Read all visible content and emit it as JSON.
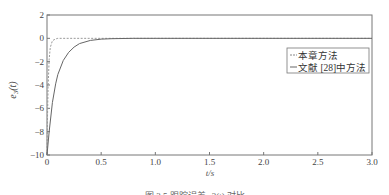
{
  "chart_data": {
    "type": "line",
    "title": "",
    "xlabel": "t/s",
    "ylabel": "e3(t)",
    "xlim": [
      0,
      3.0
    ],
    "ylim": [
      -10,
      2
    ],
    "xticks": [
      "0",
      "0.5",
      "1.0",
      "1.5",
      "2.0",
      "2.5",
      "3.0"
    ],
    "yticks": [
      "2",
      "0",
      "-2",
      "-4",
      "-6",
      "-8",
      "-10"
    ],
    "grid": false,
    "legend_position": "right-center",
    "series": [
      {
        "name": "本章方法",
        "style": "dashed",
        "x": [
          0,
          0.005,
          0.01,
          0.02,
          0.03,
          0.05,
          0.08,
          0.1,
          0.2,
          3.0
        ],
        "y": [
          -10,
          -6.5,
          -4.2,
          -1.8,
          -0.8,
          -0.2,
          -0.05,
          0,
          0,
          0
        ]
      },
      {
        "name": "文献 [28]中方法",
        "style": "solid",
        "x": [
          0,
          0.02,
          0.05,
          0.08,
          0.1,
          0.15,
          0.2,
          0.25,
          0.3,
          0.4,
          0.5,
          0.6,
          0.8,
          1.0,
          3.0
        ],
        "y": [
          -10,
          -8.0,
          -5.5,
          -3.9,
          -3.1,
          -1.9,
          -1.2,
          -0.75,
          -0.45,
          -0.18,
          -0.07,
          -0.03,
          0,
          0,
          0
        ]
      }
    ]
  },
  "legend": {
    "items": [
      "本章方法",
      "文献 [28]中方法"
    ]
  },
  "axes": {
    "xlabel": "t/s",
    "ylabel_main": "e",
    "ylabel_sub": "3",
    "ylabel_arg": "(t)"
  },
  "caption": "图 3.5  跟踪误差 e3(t) 对比"
}
